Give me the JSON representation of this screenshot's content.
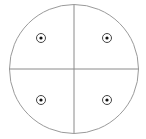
{
  "diagram": {
    "type": "quadrant-circle",
    "width": 146,
    "height": 139,
    "circle": {
      "cx": 74,
      "cy": 69,
      "r": 64.5,
      "stroke": "#9a9a9a"
    },
    "axes": {
      "vertical": {
        "x": 74,
        "y1": 5,
        "y2": 133
      },
      "horizontal": {
        "y": 69,
        "x1": 9.5,
        "x2": 138.5
      },
      "stroke": "#8a8a8a"
    },
    "markers": [
      {
        "name": "top-left",
        "x": 41,
        "y": 38
      },
      {
        "name": "top-right",
        "x": 107,
        "y": 38
      },
      {
        "name": "bottom-left",
        "x": 41,
        "y": 100
      },
      {
        "name": "bottom-right",
        "x": 107,
        "y": 100
      }
    ],
    "marker_style": {
      "ring_r": 4.5,
      "dot_r": 1.6,
      "ring_stroke": "#444444",
      "dot_fill": "#111111"
    }
  }
}
